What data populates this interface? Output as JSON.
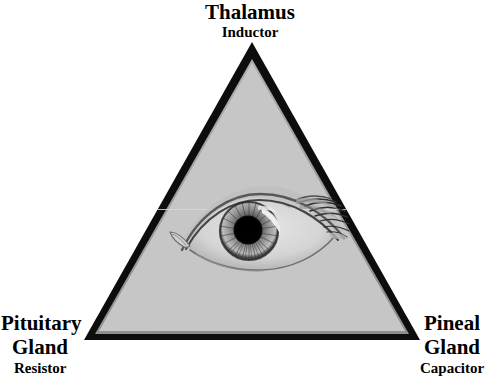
{
  "image": {
    "title": "Eye of Providence triangle diagram with gland-to-electronic-component labels",
    "background_color": "#ffffff",
    "triangle_fill_color": "#c6c6c6",
    "triangle_border_color": "#0d0d0d",
    "text_color": "#000000"
  },
  "diagram": {
    "shape": "triangle",
    "apex": {
      "x": 252,
      "y": 42
    },
    "bottom_left": {
      "x": 84,
      "y": 340
    },
    "bottom_right": {
      "x": 420,
      "y": 340
    },
    "border_thickness": 9,
    "center_graphic": "eye-of-providence"
  },
  "labels": {
    "top": {
      "name": "Thalamus",
      "component": "Inductor",
      "position": "apex"
    },
    "bottom_left": {
      "name_line1": "Pituitary",
      "name_line2": "Gland",
      "component": "Resistor",
      "position": "bottom-left-vertex"
    },
    "bottom_right": {
      "name_line1": "Pineal",
      "name_line2": "Gland",
      "component": "Capacitor",
      "position": "bottom-right-vertex"
    }
  },
  "eye": {
    "center": {
      "x": 249,
      "y": 231
    },
    "iris_radius": 28,
    "pupil_radius": 14,
    "highlight": "upper-right-crescent",
    "lashes": "upper-right",
    "tear_duct": "left"
  }
}
